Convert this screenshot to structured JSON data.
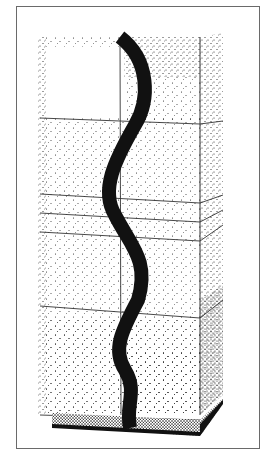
{
  "image": {
    "description": "Stippled pen-and-ink illustration of a tall rectangular cabinet with a wavy black serpentine inlay running vertically down its front",
    "colors": {
      "background": "#ffffff",
      "frame": "#6a6a6a",
      "ink": "#111111",
      "line": "#333333"
    },
    "frame": {
      "x": 16,
      "y": 6,
      "width": 244,
      "height": 443
    },
    "cabinet": {
      "front": {
        "left": 40,
        "right": 200,
        "top": 37,
        "bottom": 415
      },
      "side": {
        "right": 223,
        "top_offset": -4,
        "bottom_offset": -20
      },
      "center_line_x": 120,
      "horizontal_lines": [
        {
          "left_y": 118,
          "right_y": 124,
          "side_y": 121
        },
        {
          "left_y": 194,
          "right_y": 203,
          "side_y": 195
        },
        {
          "left_y": 213,
          "right_y": 222,
          "side_y": 210
        },
        {
          "left_y": 232,
          "right_y": 241,
          "side_y": 225
        },
        {
          "left_y": 306,
          "right_y": 318,
          "side_y": 300
        }
      ],
      "base": {
        "left": 52,
        "right": 200,
        "top": 413,
        "bottom": 436
      }
    },
    "serpentine": {
      "path": "M120 37 C150 60 150 100 135 125 C115 160 100 190 115 215 C130 245 150 260 138 300 C122 330 112 350 125 370 C138 392 125 405 130 428",
      "stroke_width": 14
    }
  }
}
